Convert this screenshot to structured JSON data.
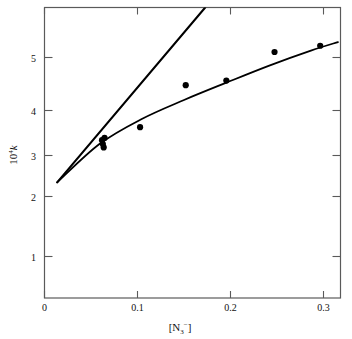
{
  "chart_data": {
    "type": "scatter",
    "title": "",
    "subtitle": "",
    "xlabel": "[N3-]",
    "xlabel_parts": {
      "open": "[N",
      "sub": "3",
      "sup": "−",
      "close": "]"
    },
    "ylabel": "104k",
    "ylabel_parts": {
      "base": "10",
      "sup": "4",
      "var": "k"
    },
    "xlim": [
      -0.015,
      0.335
    ],
    "ylim": [
      0.72,
      6.6
    ],
    "yscale": "log",
    "xscale": "linear",
    "grid": false,
    "legend": null,
    "xticks": [
      0,
      0.1,
      0.2,
      0.3
    ],
    "xtick_labels": [
      "0",
      "0.1",
      "0.2",
      "0.3"
    ],
    "yticks": [
      1,
      2,
      3,
      4,
      5
    ],
    "ytick_labels": [
      "1",
      "2",
      "3",
      "4",
      "5"
    ],
    "points": [
      {
        "x": 0.053,
        "y": 2.4
      },
      {
        "x": 0.054,
        "y": 2.33
      },
      {
        "x": 0.055,
        "y": 2.27
      },
      {
        "x": 0.056,
        "y": 2.44
      },
      {
        "x": 0.098,
        "y": 2.65
      },
      {
        "x": 0.152,
        "y": 3.65
      },
      {
        "x": 0.2,
        "y": 3.78
      },
      {
        "x": 0.257,
        "y": 4.7
      },
      {
        "x": 0.311,
        "y": 4.93
      }
    ],
    "series": [
      {
        "name": "upper-steep-line",
        "type": "line",
        "points": [
          {
            "x": 0.0,
            "y": 1.74
          },
          {
            "x": 0.175,
            "y": 6.6
          }
        ],
        "note": "steep straight line rising off top of frame"
      },
      {
        "name": "lower-fitted-curve",
        "type": "line",
        "points": [
          {
            "x": 0.0,
            "y": 1.74
          },
          {
            "x": 0.05,
            "y": 2.33
          },
          {
            "x": 0.1,
            "y": 2.82
          },
          {
            "x": 0.15,
            "y": 3.26
          },
          {
            "x": 0.2,
            "y": 3.72
          },
          {
            "x": 0.25,
            "y": 4.23
          },
          {
            "x": 0.3,
            "y": 4.75
          },
          {
            "x": 0.332,
            "y": 5.07
          }
        ],
        "note": "gently curving fitted line through the data points"
      }
    ],
    "colors": {
      "line": "#000000",
      "marker": "#000000",
      "axis": "#555555",
      "background": "#ffffff"
    }
  }
}
